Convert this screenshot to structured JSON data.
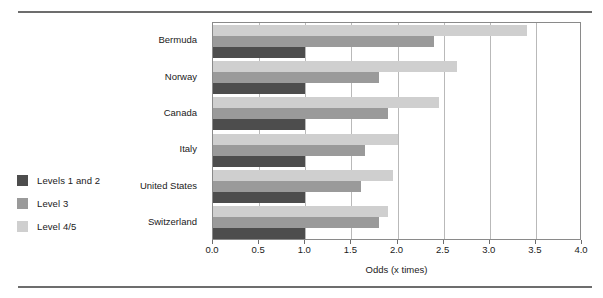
{
  "chart_data": {
    "type": "bar",
    "orientation": "horizontal",
    "title": "",
    "xlabel": "Odds (x times)",
    "ylabel": "",
    "xlim": [
      0.0,
      4.0
    ],
    "xticks": [
      "0.0",
      "0.5",
      "1.0",
      "1.5",
      "2.0",
      "2.5",
      "3.0",
      "3.5",
      "4.0"
    ],
    "xtick_values": [
      0.0,
      0.5,
      1.0,
      1.5,
      2.0,
      2.5,
      3.0,
      3.5,
      4.0
    ],
    "grid": "vertical",
    "legend_position": "left-outside",
    "categories": [
      "Bermuda",
      "Norway",
      "Canada",
      "Italy",
      "United States",
      "Switzerland"
    ],
    "series": [
      {
        "name": "Levels 1 and 2",
        "color": "#4d4d4d",
        "values": [
          1.0,
          1.0,
          1.0,
          1.0,
          1.0,
          1.0
        ]
      },
      {
        "name": "Level 3",
        "color": "#9a9a9a",
        "values": [
          2.4,
          1.8,
          1.9,
          1.65,
          1.6,
          1.8
        ]
      },
      {
        "name": "Level 4/5",
        "color": "#cfcfcf",
        "values": [
          3.4,
          2.65,
          2.45,
          2.0,
          1.95,
          1.9
        ]
      }
    ]
  },
  "legend": {
    "items": [
      {
        "label": "Levels 1 and 2",
        "color": "#4d4d4d"
      },
      {
        "label": "Level 3",
        "color": "#9a9a9a"
      },
      {
        "label": "Level 4/5",
        "color": "#cfcfcf"
      }
    ]
  },
  "axis": {
    "x_title": "Odds (x times)"
  }
}
